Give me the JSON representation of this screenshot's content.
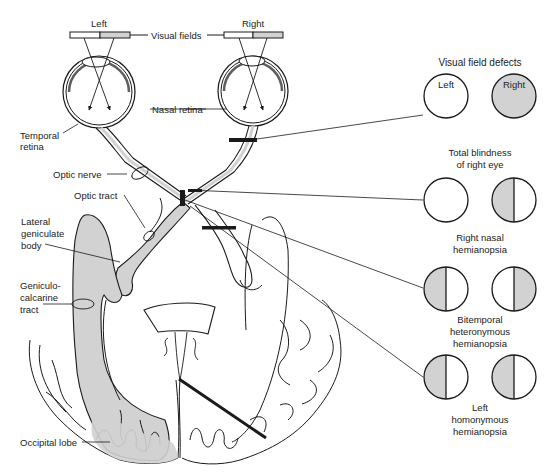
{
  "diagram": {
    "eyes": {
      "left_label": "Left",
      "right_label": "Right",
      "visual_fields_label": "Visual fields",
      "nasal_retina_label": "Nasal retina",
      "temporal_retina_label_line1": "Temporal",
      "temporal_retina_label_line2": "retina"
    },
    "pathway_labels": {
      "optic_nerve": "Optic nerve",
      "optic_tract": "Optic tract",
      "lateral_geniculate_line1": "Lateral",
      "lateral_geniculate_line2": "geniculate",
      "lateral_geniculate_line3": "body",
      "geniculo_line1": "Geniculo-",
      "geniculo_line2": "calcarine",
      "geniculo_line3": "tract",
      "occipital_lobe": "Occipital lobe"
    },
    "defects": {
      "title": "Visual field defects",
      "col_left": "Left",
      "col_right": "Right",
      "rows": [
        {
          "caption_line1": "Total blindness",
          "caption_line2": "of right eye",
          "caption_line3": "",
          "left_field": "normal",
          "right_field": "full-loss"
        },
        {
          "caption_line1": "Right nasal",
          "caption_line2": "hemianopsia",
          "caption_line3": "",
          "left_field": "normal",
          "right_field": "left-half-loss"
        },
        {
          "caption_line1": "Bitemporal",
          "caption_line2": "heteronymous",
          "caption_line3": "hemianopsia",
          "left_field": "left-half-loss",
          "right_field": "right-half-loss"
        },
        {
          "caption_line1": "Left",
          "caption_line2": "homonymous",
          "caption_line3": "hemianopsia",
          "left_field": "left-half-loss",
          "right_field": "left-half-loss"
        }
      ]
    },
    "colors": {
      "stroke": "#1a1a1a",
      "shade": "#d2d2d2",
      "background": "#ffffff"
    }
  }
}
